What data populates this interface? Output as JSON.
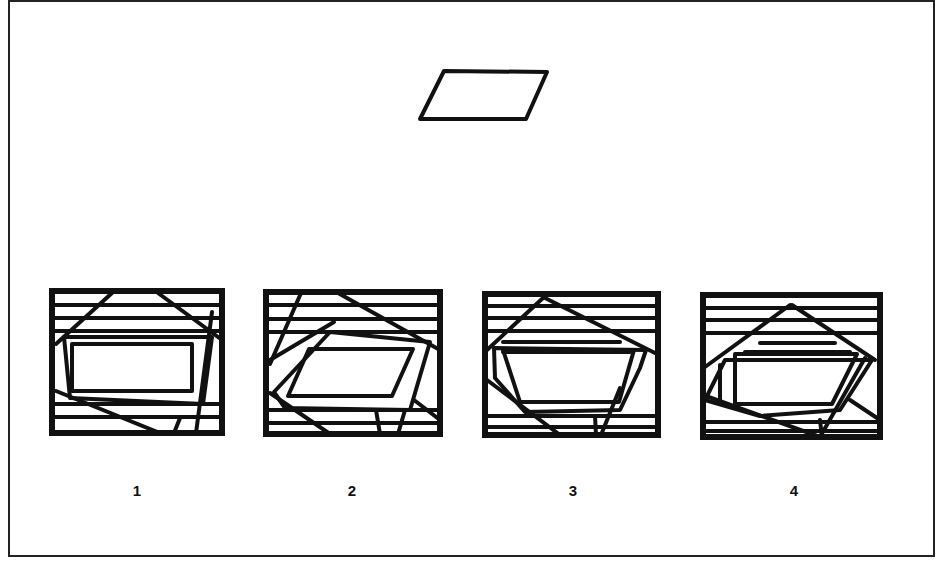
{
  "frame": {
    "x": 9,
    "y": 1,
    "w": 925,
    "h": 555,
    "stroke": "#222222",
    "stroke_width": 2
  },
  "ink": "#111111",
  "target": {
    "name": "parallelogram",
    "points": [
      [
        444,
        71
      ],
      [
        547,
        72
      ],
      [
        526,
        119
      ],
      [
        420,
        119
      ]
    ],
    "stroke_width": 4
  },
  "options": [
    {
      "label": "1",
      "label_pos": [
        137,
        482
      ],
      "box": [
        52,
        291,
        222,
        433
      ],
      "lines": [
        [
          52,
          305,
          222,
          305
        ],
        [
          52,
          318,
          222,
          318
        ],
        [
          52,
          331,
          222,
          331
        ],
        [
          52,
          404,
          222,
          404
        ],
        [
          52,
          417,
          222,
          417
        ],
        [
          112,
          293,
          56,
          344
        ],
        [
          158,
          293,
          222,
          340
        ],
        [
          56,
          391,
          160,
          433
        ],
        [
          212,
          312,
          196,
          433
        ],
        [
          180,
          418,
          174,
          433
        ]
      ],
      "polys": [
        [
          [
            72,
            344
          ],
          [
            192,
            344
          ],
          [
            192,
            391
          ],
          [
            72,
            391
          ]
        ],
        [
          [
            64,
            337
          ],
          [
            212,
            337
          ],
          [
            203,
            404
          ],
          [
            70,
            398
          ]
        ]
      ]
    },
    {
      "label": "2",
      "label_pos": [
        352,
        482
      ],
      "box": [
        266,
        292,
        440,
        434
      ],
      "lines": [
        [
          266,
          305,
          440,
          305
        ],
        [
          266,
          319,
          440,
          319
        ],
        [
          266,
          332,
          440,
          332
        ],
        [
          266,
          410,
          440,
          410
        ],
        [
          266,
          423,
          440,
          423
        ],
        [
          301,
          293,
          270,
          364
        ],
        [
          338,
          293,
          440,
          350
        ],
        [
          334,
          322,
          270,
          360
        ],
        [
          270,
          393,
          330,
          434
        ],
        [
          414,
          400,
          440,
          420
        ],
        [
          376,
          410,
          380,
          434
        ],
        [
          405,
          410,
          398,
          434
        ]
      ],
      "polys": [
        [
          [
            309,
            349
          ],
          [
            413,
            349
          ],
          [
            392,
            396
          ],
          [
            288,
            396
          ]
        ],
        [
          [
            330,
            332
          ],
          [
            430,
            342
          ],
          [
            410,
            410
          ],
          [
            285,
            408
          ],
          [
            274,
            392
          ]
        ]
      ]
    },
    {
      "label": "3",
      "label_pos": [
        573,
        482
      ],
      "box": [
        485,
        294,
        658,
        435
      ],
      "lines": [
        [
          485,
          306,
          658,
          306
        ],
        [
          485,
          318,
          658,
          318
        ],
        [
          485,
          331,
          658,
          331
        ],
        [
          503,
          342,
          620,
          342
        ],
        [
          503,
          352,
          630,
          352
        ],
        [
          485,
          416,
          658,
          416
        ],
        [
          485,
          427,
          658,
          427
        ],
        [
          543,
          298,
          487,
          350
        ],
        [
          545,
          298,
          655,
          353
        ],
        [
          487,
          380,
          560,
          435
        ],
        [
          620,
          388,
          601,
          435
        ],
        [
          595,
          416,
          596,
          435
        ]
      ],
      "polys": [
        [
          [
            503,
            350
          ],
          [
            634,
            350
          ],
          [
            619,
            402
          ],
          [
            520,
            402
          ]
        ],
        [
          [
            494,
            348
          ],
          [
            646,
            350
          ],
          [
            640,
            368
          ],
          [
            620,
            410
          ],
          [
            525,
            412
          ],
          [
            495,
            378
          ]
        ]
      ]
    },
    {
      "label": "4",
      "label_pos": [
        794,
        482
      ],
      "box": [
        703,
        295,
        880,
        437
      ],
      "lines": [
        [
          703,
          308,
          880,
          308
        ],
        [
          703,
          320,
          880,
          320
        ],
        [
          703,
          333,
          880,
          333
        ],
        [
          760,
          343,
          835,
          343
        ],
        [
          745,
          352,
          850,
          352
        ],
        [
          703,
          422,
          880,
          422
        ],
        [
          703,
          431,
          880,
          431
        ],
        [
          790,
          305,
          705,
          367
        ],
        [
          792,
          305,
          875,
          360
        ],
        [
          720,
          365,
          720,
          400
        ],
        [
          865,
          358,
          820,
          437
        ],
        [
          850,
          400,
          880,
          420
        ],
        [
          703,
          395,
          820,
          437
        ],
        [
          820,
          420,
          822,
          437
        ]
      ],
      "polys": [
        [
          [
            735,
            354
          ],
          [
            857,
            354
          ],
          [
            832,
            404
          ],
          [
            735,
            404
          ]
        ],
        [
          [
            725,
            360
          ],
          [
            872,
            360
          ],
          [
            840,
            410
          ],
          [
            760,
            416
          ],
          [
            705,
            400
          ]
        ]
      ]
    }
  ]
}
